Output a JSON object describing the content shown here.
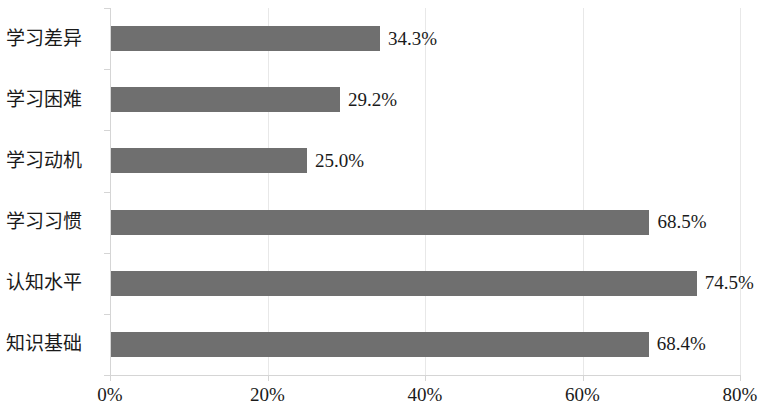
{
  "chart_data": {
    "type": "bar",
    "orientation": "horizontal",
    "title": "",
    "subtitle": "",
    "xlabel": "",
    "ylabel": "",
    "categories": [
      "学习差异",
      "学习困难",
      "学习动机",
      "学习习惯",
      "认知水平",
      "知识基础"
    ],
    "values": [
      34.3,
      29.2,
      25.0,
      68.5,
      74.5,
      68.4
    ],
    "value_labels": [
      "34.3%",
      "29.2%",
      "25.0%",
      "68.5%",
      "74.5%",
      "68.4%"
    ],
    "xlim": [
      0,
      80
    ],
    "xticks": [
      0,
      20,
      40,
      60,
      80
    ],
    "xtick_labels": [
      "0%",
      "20%",
      "40%",
      "60%",
      "80%"
    ],
    "grid": true,
    "grid_axis": "x",
    "legend": false,
    "series": [
      {
        "name": "",
        "values": [
          34.3,
          29.2,
          25.0,
          68.5,
          74.5,
          68.4
        ]
      }
    ],
    "colors": {
      "bar": "#6f6f6f",
      "grid": "#e8e8e8",
      "axis": "#d5d5d5",
      "text": "#1a1a1a",
      "background": "#ffffff"
    }
  }
}
